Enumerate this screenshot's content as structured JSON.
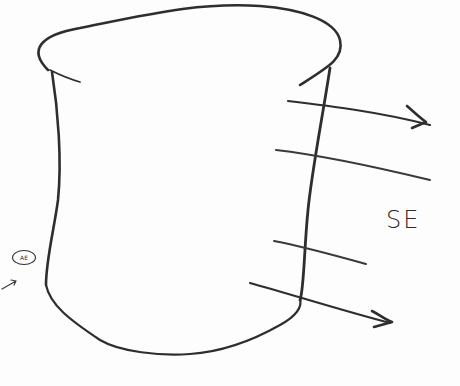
{
  "sketch": {
    "title": "Hand-drawn cylinder with flux lines",
    "stroke_color": "#2e2e2e",
    "labels": {
      "side_label": "SE",
      "circled_symbol": "AE"
    },
    "shapes": {
      "container": "cylinder / cup outline",
      "crossing_lines_count": 4,
      "arrows_count": 2
    }
  }
}
